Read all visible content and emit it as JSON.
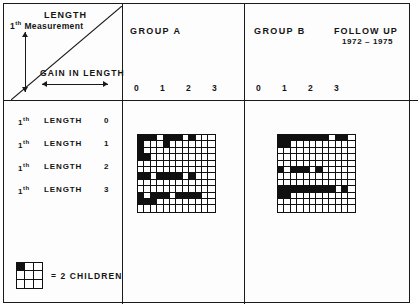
{
  "figure": {
    "axis_legend": {
      "length_label": "LENGTH",
      "measurement_prefix": "1",
      "measurement_sup": "th",
      "measurement_label": "Measurement",
      "gain_label": "GAIN IN LENGTH",
      "vertical_arrow": "vertical-double-arrow-icon",
      "horizontal_arrow": "horizontal-double-arrow-icon",
      "diagonal": "diagonal-hypotenuse-line"
    },
    "headers": {
      "group_a": "GROUP A",
      "group_b": "GROUP B",
      "follow_up": "FOLLOW UP",
      "years": "1972 – 1975"
    },
    "x_ticks": [
      "0",
      "1",
      "2",
      "3"
    ],
    "row_labels": [
      {
        "prefix": "1",
        "sup": "th",
        "word": "LENGTH",
        "num": "0"
      },
      {
        "prefix": "1",
        "sup": "th",
        "word": "LENGTH",
        "num": "1"
      },
      {
        "prefix": "1",
        "sup": "th",
        "word": "LENGTH",
        "num": "2"
      },
      {
        "prefix": "1",
        "sup": "th",
        "word": "LENGTH",
        "num": "3"
      }
    ],
    "key": {
      "text": "= 2 CHILDREN",
      "filled_cell_index": 0,
      "grid_rows": 3,
      "grid_cols": 3
    },
    "colors": {
      "ink": "#101010",
      "paper": "#ffffff",
      "frame": "#1a1a1a"
    }
  },
  "chart_data": {
    "type": "heatmap",
    "xlabel": "GAIN IN LENGTH",
    "ylabel": "1th LENGTH / 1th Measurement",
    "unit_note": "one filled cell = 2 CHILDREN",
    "xtick_labels": [
      "0",
      "1",
      "2",
      "3"
    ],
    "ytick_labels": [
      "1th LENGTH 0",
      "1th LENGTH 1",
      "1th LENGTH 2",
      "1th LENGTH 3"
    ],
    "grid": true,
    "legend_position": "bottom-left",
    "panels": [
      {
        "name": "GROUP A",
        "rows": 12,
        "cols": 12,
        "cells": [
          [
            1,
            1,
            1,
            0,
            1,
            1,
            1,
            0,
            1,
            0,
            0,
            0
          ],
          [
            1,
            0,
            0,
            0,
            1,
            0,
            0,
            0,
            0,
            0,
            0,
            0
          ],
          [
            1,
            0,
            0,
            0,
            0,
            0,
            0,
            0,
            0,
            0,
            0,
            0
          ],
          [
            1,
            1,
            0,
            0,
            0,
            0,
            0,
            0,
            0,
            0,
            0,
            0
          ],
          [
            0,
            0,
            0,
            0,
            0,
            0,
            0,
            0,
            0,
            0,
            0,
            0
          ],
          [
            0,
            0,
            0,
            0,
            0,
            0,
            0,
            0,
            0,
            0,
            0,
            0
          ],
          [
            1,
            1,
            0,
            1,
            1,
            1,
            1,
            0,
            1,
            0,
            0,
            0
          ],
          [
            0,
            0,
            0,
            0,
            0,
            0,
            0,
            0,
            0,
            0,
            0,
            0
          ],
          [
            0,
            0,
            0,
            0,
            0,
            0,
            0,
            0,
            0,
            0,
            0,
            0
          ],
          [
            1,
            0,
            1,
            1,
            1,
            0,
            1,
            1,
            1,
            1,
            0,
            0
          ],
          [
            1,
            1,
            1,
            0,
            0,
            0,
            0,
            0,
            0,
            0,
            0,
            0
          ],
          [
            0,
            0,
            0,
            0,
            0,
            0,
            0,
            0,
            0,
            0,
            0,
            0
          ]
        ]
      },
      {
        "name": "GROUP B",
        "rows": 12,
        "cols": 12,
        "cells": [
          [
            1,
            1,
            1,
            1,
            1,
            1,
            1,
            1,
            0,
            1,
            1,
            0
          ],
          [
            1,
            1,
            0,
            0,
            0,
            0,
            0,
            0,
            0,
            0,
            0,
            0
          ],
          [
            0,
            0,
            0,
            0,
            0,
            0,
            0,
            0,
            0,
            0,
            0,
            0
          ],
          [
            0,
            0,
            0,
            0,
            0,
            0,
            0,
            0,
            0,
            0,
            0,
            0
          ],
          [
            0,
            0,
            0,
            0,
            0,
            0,
            0,
            0,
            0,
            0,
            0,
            0
          ],
          [
            1,
            0,
            1,
            1,
            1,
            0,
            1,
            0,
            0,
            0,
            0,
            0
          ],
          [
            0,
            0,
            0,
            0,
            0,
            0,
            0,
            0,
            0,
            0,
            0,
            0
          ],
          [
            0,
            0,
            0,
            0,
            0,
            0,
            0,
            0,
            0,
            0,
            0,
            0
          ],
          [
            1,
            1,
            1,
            1,
            1,
            1,
            1,
            1,
            1,
            0,
            1,
            0
          ],
          [
            1,
            1,
            0,
            0,
            0,
            0,
            0,
            0,
            0,
            0,
            0,
            0
          ],
          [
            0,
            0,
            0,
            0,
            0,
            0,
            0,
            0,
            0,
            0,
            0,
            0
          ],
          [
            0,
            0,
            0,
            0,
            0,
            0,
            0,
            0,
            0,
            0,
            0,
            0
          ]
        ]
      }
    ]
  }
}
